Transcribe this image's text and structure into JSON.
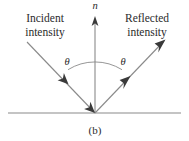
{
  "figure": {
    "caption": "(b)",
    "labels": {
      "incident": "Incident\nintensity",
      "reflected": "Reflected\nintensity",
      "normal": "n",
      "angle_left": "θ",
      "angle_right": "θ"
    },
    "colors": {
      "background": "#ffffff",
      "text": "#2b2b2b",
      "ray": "#8a8a8a",
      "normal_line": "#8a8a8a",
      "surface_line": "#8a8a8a",
      "arc": "#8a8a8a",
      "arrowhead": "#3a3a3a"
    },
    "geometry": {
      "vertex_x": 95,
      "vertex_y": 113,
      "normal_top_y": 18,
      "incident_start_x": 27,
      "incident_start_y": 42,
      "reflected_end_x": 164,
      "reflected_end_y": 41,
      "surface_left_x": 8,
      "surface_right_x": 181,
      "surface_y": 113,
      "arc_radius": 51,
      "angle_left_deg": 32,
      "angle_right_deg": 32
    }
  }
}
